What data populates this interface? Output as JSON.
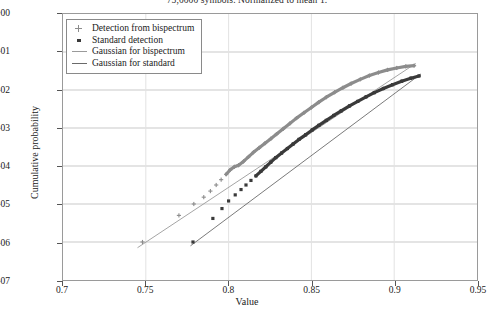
{
  "chart_data": {
    "type": "scatter",
    "title": "75,0000 symbols. Normalized to mean 1.",
    "xlabel": "Value",
    "ylabel": "Cumulative probability",
    "xlim": [
      0.7,
      0.95
    ],
    "ylim_log": [
      -7,
      0
    ],
    "yscale": "log",
    "grid": true,
    "legend_position": "upper-left",
    "xticks": [
      "0.7",
      "0.75",
      "0.8",
      "0.85",
      "0.9",
      "0.95"
    ],
    "xtick_values": [
      0.7,
      0.75,
      0.8,
      0.85,
      0.9,
      0.95
    ],
    "yticks": [
      "1e+00",
      "1e-01",
      "1e-02",
      "1e-03",
      "1e-04",
      "1e-05",
      "1e-06",
      "1e-07"
    ],
    "ytick_exponents": [
      0,
      -1,
      -2,
      -3,
      -4,
      -5,
      -6,
      -7
    ],
    "series": [
      {
        "name": "Detection from bispectrum",
        "marker": "cross",
        "color": "#8c8c8c",
        "points": [
          [
            0.748,
            -6.0
          ],
          [
            0.77,
            -5.3
          ],
          [
            0.779,
            -5.0
          ],
          [
            0.785,
            -4.82
          ],
          [
            0.789,
            -4.66
          ],
          [
            0.7925,
            -4.5
          ],
          [
            0.7955,
            -4.36
          ],
          [
            0.7985,
            -4.22
          ],
          [
            0.801,
            -4.1
          ],
          [
            0.8035,
            -4.02
          ],
          [
            0.806,
            -3.98
          ],
          [
            0.809,
            -3.88
          ],
          [
            0.812,
            -3.76
          ],
          [
            0.815,
            -3.64
          ],
          [
            0.8185,
            -3.52
          ],
          [
            0.822,
            -3.4
          ],
          [
            0.8255,
            -3.28
          ],
          [
            0.829,
            -3.16
          ],
          [
            0.833,
            -3.02
          ],
          [
            0.837,
            -2.88
          ],
          [
            0.841,
            -2.74
          ],
          [
            0.8455,
            -2.6
          ],
          [
            0.85,
            -2.46
          ],
          [
            0.8545,
            -2.32
          ],
          [
            0.859,
            -2.19
          ],
          [
            0.864,
            -2.06
          ],
          [
            0.869,
            -1.94
          ],
          [
            0.874,
            -1.83
          ],
          [
            0.8795,
            -1.72
          ],
          [
            0.885,
            -1.62
          ],
          [
            0.8905,
            -1.54
          ],
          [
            0.896,
            -1.47
          ],
          [
            0.9015,
            -1.42
          ],
          [
            0.907,
            -1.38
          ],
          [
            0.912,
            -1.36
          ]
        ]
      },
      {
        "name": "Standard detection",
        "marker": "square",
        "color": "#3a3a3a",
        "points": [
          [
            0.7785,
            -6.0
          ],
          [
            0.7905,
            -5.38
          ],
          [
            0.796,
            -5.12
          ],
          [
            0.8,
            -4.92
          ],
          [
            0.804,
            -4.76
          ],
          [
            0.8075,
            -4.62
          ],
          [
            0.8105,
            -4.5
          ],
          [
            0.8135,
            -4.38
          ],
          [
            0.8165,
            -4.26
          ],
          [
            0.8195,
            -4.14
          ],
          [
            0.8225,
            -4.02
          ],
          [
            0.8255,
            -3.9
          ],
          [
            0.8285,
            -3.78
          ],
          [
            0.832,
            -3.66
          ],
          [
            0.8355,
            -3.54
          ],
          [
            0.839,
            -3.42
          ],
          [
            0.8425,
            -3.3
          ],
          [
            0.8465,
            -3.18
          ],
          [
            0.8505,
            -3.05
          ],
          [
            0.8545,
            -2.93
          ],
          [
            0.859,
            -2.8
          ],
          [
            0.8635,
            -2.67
          ],
          [
            0.868,
            -2.55
          ],
          [
            0.873,
            -2.42
          ],
          [
            0.878,
            -2.3
          ],
          [
            0.883,
            -2.18
          ],
          [
            0.888,
            -2.07
          ],
          [
            0.8935,
            -1.96
          ],
          [
            0.899,
            -1.86
          ],
          [
            0.9045,
            -1.77
          ],
          [
            0.91,
            -1.69
          ],
          [
            0.915,
            -1.63
          ]
        ]
      }
    ],
    "fit_lines": [
      {
        "name": "Gaussian for bispectrum",
        "color": "#9a9a9a",
        "x": [
          0.745,
          0.913
        ],
        "y_log": [
          -6.15,
          -1.3
        ]
      },
      {
        "name": "Gaussian for standard",
        "color": "#6a6a6a",
        "x": [
          0.777,
          0.916
        ],
        "y_log": [
          -6.1,
          -1.58
        ]
      }
    ],
    "legend_entries": [
      {
        "label": "Detection from bispectrum",
        "swatch": "cross-marker",
        "color": "#8c8c8c"
      },
      {
        "label": "Standard detection",
        "swatch": "square-marker",
        "color": "#3a3a3a"
      },
      {
        "label": "Gaussian for bispectrum",
        "swatch": "line",
        "color": "#9a9a9a"
      },
      {
        "label": "Gaussian for standard",
        "swatch": "line",
        "color": "#6a6a6a"
      }
    ]
  }
}
